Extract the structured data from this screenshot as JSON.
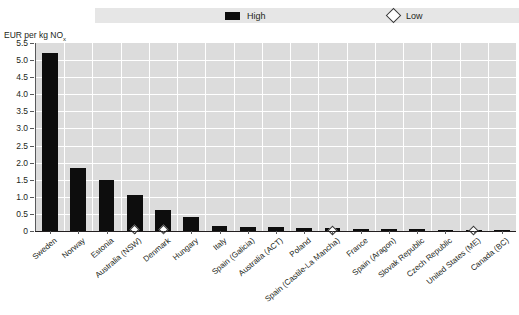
{
  "legend": {
    "items": [
      {
        "label": "High",
        "marker": "filled-square",
        "color": "#0d0d0d"
      },
      {
        "label": "Low",
        "marker": "open-diamond",
        "color": "#ffffff"
      }
    ]
  },
  "axis": {
    "y_title_main": "EUR per kg NO",
    "y_title_sub": "x",
    "y_ticks": [
      "5.5",
      "5.0",
      "4.5",
      "4.0",
      "3.5",
      "3.0",
      "2.5",
      "2.0",
      "1.5",
      "1.0",
      "0.5",
      "0"
    ]
  },
  "colors": {
    "bar": "#0d0d0d",
    "plot_background": "#dcdcdc",
    "gridline": "#ffffff",
    "legend_band": "#e6e6e6",
    "axis": "#58595b",
    "text": "#231f20"
  },
  "chart_data": {
    "type": "bar",
    "title": "",
    "subtitle": "",
    "xlabel": "",
    "ylabel": "EUR per kg NOx",
    "ylim": [
      0,
      5.5
    ],
    "ytick_interval": 0.5,
    "grid": true,
    "legend_position": "top",
    "categories": [
      "Sweden",
      "Norway",
      "Estonia",
      "Australia (NSW)",
      "Denmark",
      "Hungary",
      "Italy",
      "Spain (Galicia)",
      "Australia (ACT)",
      "Poland",
      "Spain (Castile-La Mancha)",
      "France",
      "Spain (Aragon)",
      "Slovak Republic",
      "Czech Republic",
      "United States (ME)",
      "Canada (BC)"
    ],
    "series": [
      {
        "name": "High",
        "type": "bar",
        "values": [
          5.2,
          1.85,
          1.5,
          1.05,
          0.62,
          0.42,
          0.16,
          0.13,
          0.12,
          0.1,
          0.09,
          0.07,
          0.06,
          0.05,
          0.04,
          0.03,
          0.02
        ]
      },
      {
        "name": "Low",
        "type": "marker",
        "values": [
          null,
          null,
          null,
          0.03,
          0.03,
          null,
          null,
          null,
          null,
          null,
          0.02,
          null,
          null,
          null,
          null,
          0.02,
          null
        ]
      }
    ]
  }
}
